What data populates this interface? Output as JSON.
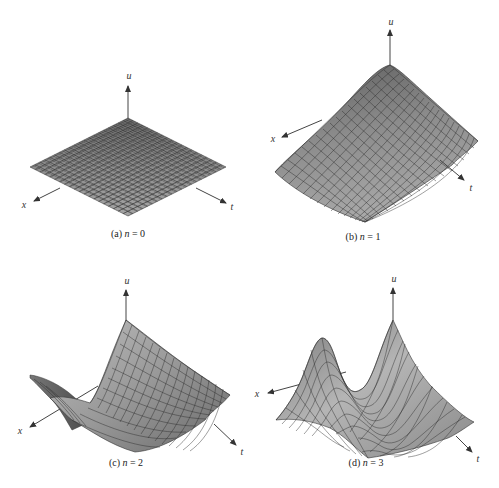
{
  "figure": {
    "panels": [
      {
        "id": "a",
        "caption_prefix": "(a)",
        "caption_var": "n",
        "caption_eq": "= 0",
        "n": 0,
        "axis_labels": {
          "u": "u",
          "x": "x",
          "t": "t"
        },
        "surface": "flat plane"
      },
      {
        "id": "b",
        "caption_prefix": "(b)",
        "caption_var": "n",
        "caption_eq": "= 1",
        "n": 1,
        "axis_labels": {
          "u": "u",
          "x": "x",
          "t": "t"
        },
        "surface": "single peak at origin, decaying along x and t"
      },
      {
        "id": "c",
        "caption_prefix": "(c)",
        "caption_var": "n",
        "caption_eq": "= 2",
        "n": 2,
        "axis_labels": {
          "u": "u",
          "x": "x",
          "t": "t"
        },
        "surface": "peak at origin with a valley along x, rising again at far x"
      },
      {
        "id": "d",
        "caption_prefix": "(d)",
        "caption_var": "n",
        "caption_eq": "= 3",
        "n": 3,
        "axis_labels": {
          "u": "u",
          "x": "x",
          "t": "t"
        },
        "surface": "two peaks along x with a valley between"
      }
    ],
    "colors": {
      "surface_light": "#b8b8b8",
      "surface_mid": "#8a8a8a",
      "surface_dark": "#555555",
      "grid_line": "#2a2a2a",
      "axis": "#444444"
    }
  }
}
